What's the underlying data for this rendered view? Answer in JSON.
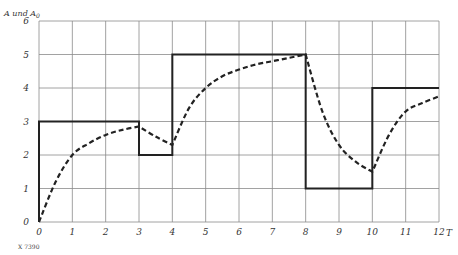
{
  "chart_data": {
    "type": "line",
    "title": "",
    "xlabel": "T",
    "ylabel": "A und A0",
    "xlim": [
      0,
      12
    ],
    "ylim": [
      0,
      6
    ],
    "grid": true,
    "x_ticks": [
      "0",
      "1",
      "2",
      "3",
      "4",
      "5",
      "6",
      "7",
      "8",
      "9",
      "10",
      "11",
      "12"
    ],
    "y_ticks": [
      "0",
      "1",
      "2",
      "3",
      "4",
      "5",
      "6"
    ],
    "series": [
      {
        "name": "A0 (step input)",
        "style": "solid",
        "points": [
          [
            0,
            0
          ],
          [
            0,
            3
          ],
          [
            3,
            3
          ],
          [
            3,
            2
          ],
          [
            4,
            2
          ],
          [
            4,
            5
          ],
          [
            8,
            5
          ],
          [
            8,
            1
          ],
          [
            10,
            1
          ],
          [
            10,
            4
          ],
          [
            12,
            4
          ]
        ]
      },
      {
        "name": "A (response)",
        "style": "dashed",
        "points": [
          [
            0,
            0
          ],
          [
            0.5,
            1.2
          ],
          [
            1,
            2.0
          ],
          [
            1.5,
            2.35
          ],
          [
            2,
            2.6
          ],
          [
            2.5,
            2.75
          ],
          [
            3,
            2.85
          ],
          [
            3.5,
            2.55
          ],
          [
            4,
            2.3
          ],
          [
            4.5,
            3.4
          ],
          [
            5,
            4.0
          ],
          [
            5.5,
            4.35
          ],
          [
            6,
            4.55
          ],
          [
            6.5,
            4.7
          ],
          [
            7,
            4.8
          ],
          [
            7.5,
            4.9
          ],
          [
            8,
            5.0
          ],
          [
            8.5,
            3.3
          ],
          [
            9,
            2.3
          ],
          [
            9.5,
            1.8
          ],
          [
            10,
            1.5
          ],
          [
            10.5,
            2.6
          ],
          [
            11,
            3.3
          ],
          [
            11.5,
            3.55
          ],
          [
            12,
            3.75
          ]
        ]
      }
    ]
  },
  "labels": {
    "y_axis_title": "A und A",
    "y_axis_subscript": "0",
    "x_axis_title": "T",
    "footnote": "X 7390"
  }
}
